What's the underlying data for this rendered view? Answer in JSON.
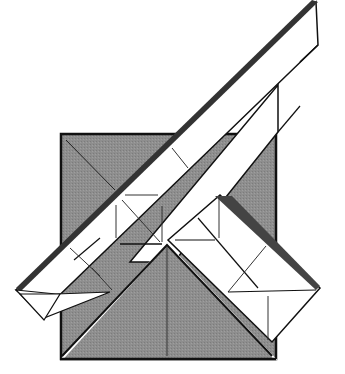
{
  "diagram": {
    "type": "origami-fold-step",
    "colors": {
      "background": "#ffffff",
      "paper_colored": "#8c8c8c",
      "paper_white": "#ffffff",
      "line": "#111111"
    },
    "parts": [
      {
        "name": "base-square",
        "description": "gray square base"
      },
      {
        "name": "diagonal-strip",
        "description": "long white strip running lower-left to upper-right"
      },
      {
        "name": "right-flap",
        "description": "white flap folded down to the right"
      },
      {
        "name": "bottom-triangle",
        "description": "gray triangle with center crease"
      }
    ]
  }
}
